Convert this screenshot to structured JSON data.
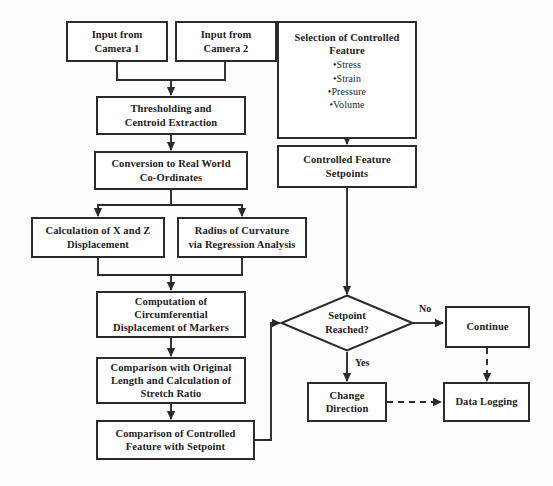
{
  "diagram": {
    "stroke_color": "#2b2b2b",
    "text_color": "#1d1d1d",
    "background_color": "#fdfdfd"
  },
  "nodes": {
    "input_camera_1": {
      "line1": "Input from",
      "line2": "Camera 1"
    },
    "input_camera_2": {
      "line1": "Input from",
      "line2": "Camera 2"
    },
    "thresholding": {
      "line1": "Thresholding and",
      "line2": "Centroid Extraction"
    },
    "conversion": {
      "line1": "Conversion to Real World",
      "line2": "Co-Ordinates"
    },
    "calculation_xz": {
      "line1": "Calculation of X and Z",
      "line2": "Displacement"
    },
    "radius_curvature": {
      "line1": "Radius of Curvature",
      "line2": "via Regression Analysis"
    },
    "computation_circumferential": {
      "line1": "Computation of",
      "line2": "Circumferential",
      "line3": "Displacement of Markers"
    },
    "comparison_original": {
      "line1": "Comparison with Original",
      "line2": "Length and Calculation of",
      "line3": "Stretch Ratio"
    },
    "comparison_controlled": {
      "line1": "Comparison of Controlled",
      "line2": "Feature with Setpoint"
    },
    "selection_controlled": {
      "line1": "Selection of Controlled",
      "line2": "Feature",
      "bullets": [
        "•Stress",
        "•Strain",
        "•Pressure",
        "•Volume"
      ]
    },
    "controlled_setpoints": {
      "line1": "Controlled Feature",
      "line2": "Setpoints"
    },
    "setpoint_reached": {
      "line1": "Setpoint",
      "line2": "Reached?"
    },
    "continue": {
      "line1": "Continue"
    },
    "change_direction": {
      "line1": "Change",
      "line2": "Direction"
    },
    "data_logging": {
      "line1": "Data Logging"
    }
  },
  "edge_labels": {
    "no": "No",
    "yes": "Yes"
  }
}
